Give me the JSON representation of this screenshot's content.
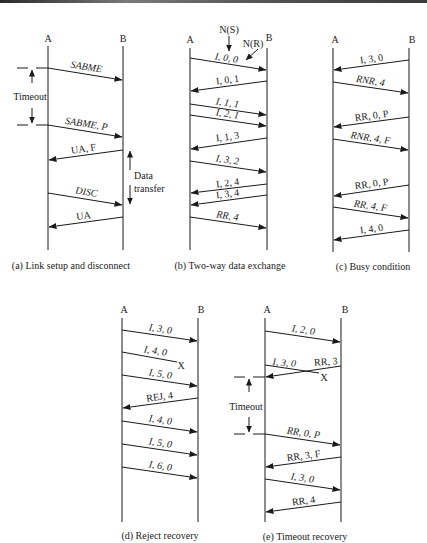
{
  "colors": {
    "ink": "#1a1a1a",
    "background": "#ffffff"
  },
  "panels": [
    {
      "id": "a",
      "caption": "(a) Link setup and disconnect",
      "station_a": "A",
      "station_b": "B",
      "messages": [
        {
          "label": "SABME",
          "dir": "A->B",
          "italic": true
        },
        {
          "label": "SABME, P",
          "dir": "A->B",
          "italic": true
        },
        {
          "label": "UA, F",
          "dir": "B->A",
          "italic": false
        },
        {
          "label": "DISC",
          "dir": "A->B",
          "italic": true
        },
        {
          "label": "UA",
          "dir": "B->A",
          "italic": false
        }
      ],
      "annotations": {
        "timeout": "Timeout",
        "data_transfer_line1": "Data",
        "data_transfer_line2": "transfer"
      }
    },
    {
      "id": "b",
      "caption": "(b) Two-way data exchange",
      "station_a": "A",
      "station_b": "B",
      "annotations": {
        "ns": "N(S)",
        "nr": "N(R)"
      },
      "messages": [
        {
          "label": "I, 0, 0",
          "dir": "A->B",
          "italic": true
        },
        {
          "label": "I, 0, 1",
          "dir": "B->A",
          "italic": false
        },
        {
          "label": "I, 1, 1",
          "dir": "A->B",
          "italic": true
        },
        {
          "label": "I, 2, 1",
          "dir": "A->B",
          "italic": true
        },
        {
          "label": "I, 1, 3",
          "dir": "B->A",
          "italic": false
        },
        {
          "label": "I, 3, 2",
          "dir": "A->B",
          "italic": true
        },
        {
          "label": "I, 2, 4",
          "dir": "B->A",
          "italic": false
        },
        {
          "label": "I, 3, 4",
          "dir": "B->A",
          "italic": false
        },
        {
          "label": "RR, 4",
          "dir": "A->B",
          "italic": true
        }
      ]
    },
    {
      "id": "c",
      "caption": "(c) Busy condition",
      "station_a": "A",
      "station_b": "B",
      "messages": [
        {
          "label": "I, 3, 0",
          "dir": "B->A",
          "italic": false
        },
        {
          "label": "RNR, 4",
          "dir": "A->B",
          "italic": true
        },
        {
          "label": "RR, 0, P",
          "dir": "B->A",
          "italic": false
        },
        {
          "label": "RNR, 4, F",
          "dir": "A->B",
          "italic": true
        },
        {
          "label": "RR, 0, P",
          "dir": "B->A",
          "italic": false
        },
        {
          "label": "RR, 4, F",
          "dir": "A->B",
          "italic": true
        },
        {
          "label": "I, 4, 0",
          "dir": "B->A",
          "italic": false
        }
      ]
    },
    {
      "id": "d",
      "caption": "(d) Reject recovery",
      "station_a": "A",
      "station_b": "B",
      "messages": [
        {
          "label": "I, 3, 0",
          "dir": "A->B",
          "italic": true
        },
        {
          "label": "I, 4, 0",
          "dir": "A->B",
          "italic": true,
          "lost": true,
          "lost_mark": "X"
        },
        {
          "label": "I, 5, 0",
          "dir": "A->B",
          "italic": true
        },
        {
          "label": "REJ, 4",
          "dir": "B->A",
          "italic": false
        },
        {
          "label": "I, 4, 0",
          "dir": "A->B",
          "italic": true
        },
        {
          "label": "I, 5, 0",
          "dir": "A->B",
          "italic": true
        },
        {
          "label": "I, 6, 0",
          "dir": "A->B",
          "italic": true
        }
      ]
    },
    {
      "id": "e",
      "caption": "(e) Timeout recovery",
      "station_a": "A",
      "station_b": "B",
      "messages": [
        {
          "label": "I, 2, 0",
          "dir": "A->B",
          "italic": true
        },
        {
          "label": "I, 3, 0",
          "dir": "A->B",
          "italic": true,
          "lost": true,
          "lost_mark": "X"
        },
        {
          "label": "RR, 3",
          "dir": "B->A",
          "italic": false
        },
        {
          "label": "RR, 0, P",
          "dir": "A->B",
          "italic": true
        },
        {
          "label": "RR, 3, F",
          "dir": "B->A",
          "italic": false
        },
        {
          "label": "I, 3, 0",
          "dir": "A->B",
          "italic": true
        },
        {
          "label": "RR, 4",
          "dir": "B->A",
          "italic": false
        }
      ],
      "annotations": {
        "timeout": "Timeout"
      }
    }
  ]
}
